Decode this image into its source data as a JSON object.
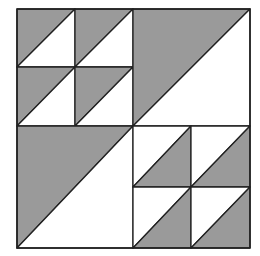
{
  "diagram": {
    "title": "",
    "type": "quilt-block",
    "colors": {
      "shaded": "#9a9a9a",
      "unshaded": "#ffffff",
      "line": "#222222"
    },
    "quadrants": [
      {
        "position": "top-left",
        "pattern": "2x2 half-square triangles",
        "shaded_side": "upper-left"
      },
      {
        "position": "top-right",
        "pattern": "single half-square triangle",
        "shaded_side": "upper-left"
      },
      {
        "position": "bottom-left",
        "pattern": "single half-square triangle",
        "shaded_side": "upper-left"
      },
      {
        "position": "bottom-right",
        "pattern": "2x2 half-square triangles",
        "shaded_side": "lower-right"
      }
    ]
  }
}
